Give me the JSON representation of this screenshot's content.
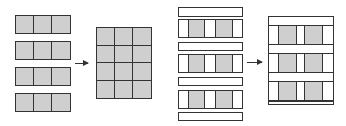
{
  "diagram": {
    "colors": {
      "fill": "#cfcfcf",
      "stroke": "#333333",
      "background": "#ffffff"
    },
    "left_figure": {
      "input": {
        "strip_count": 4,
        "cells_per_strip": 3,
        "cell_fill": "gray"
      },
      "arrow": "right-arrow",
      "output": {
        "rows": 4,
        "cols": 3,
        "cell_fill": "gray"
      }
    },
    "right_figure": {
      "input": {
        "sequence": [
          "bar",
          "strip",
          "bar",
          "strip",
          "bar",
          "strip",
          "bar"
        ],
        "strip_pattern": [
          "white",
          "gray",
          "white",
          "gray",
          "white"
        ]
      },
      "arrow": "right-arrow",
      "output": {
        "sequence": [
          "bar",
          "strip",
          "bar",
          "strip",
          "bar",
          "strip",
          "bar"
        ],
        "strip_pattern": [
          "white",
          "gray",
          "white",
          "gray",
          "white"
        ]
      }
    }
  }
}
